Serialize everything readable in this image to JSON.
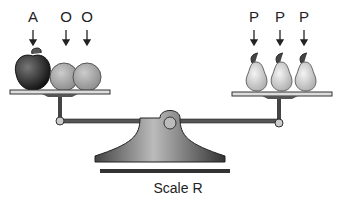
{
  "diagram": {
    "caption": "Scale R",
    "left_pan": {
      "items": [
        {
          "label": "A",
          "fruit": "apple"
        },
        {
          "label": "O",
          "fruit": "orange"
        },
        {
          "label": "O",
          "fruit": "orange"
        }
      ]
    },
    "right_pan": {
      "items": [
        {
          "label": "P",
          "fruit": "pear"
        },
        {
          "label": "P",
          "fruit": "pear"
        },
        {
          "label": "P",
          "fruit": "pear"
        }
      ]
    },
    "state": "balanced"
  }
}
